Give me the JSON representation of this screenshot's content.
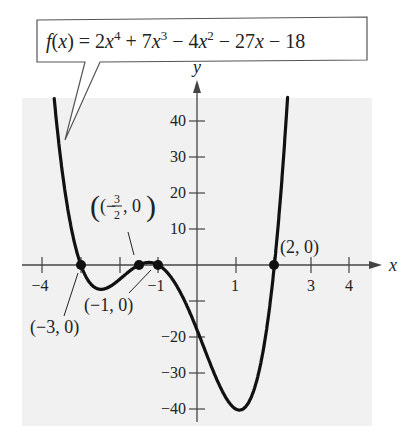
{
  "chart_data": {
    "type": "line",
    "function": {
      "expression": "f(x) = 2x^4 + 7x^3 - 4x^2 - 27x - 18",
      "coefficients": [
        2,
        7,
        -4,
        -27,
        -18
      ]
    },
    "xlabel": "x",
    "ylabel": "y",
    "xlim": [
      -4.5,
      4.6
    ],
    "ylim": [
      -45,
      48
    ],
    "x_ticks": [
      -4,
      -3,
      -2,
      -1,
      1,
      2,
      3,
      4
    ],
    "x_tick_labels": [
      "-4",
      "-1",
      "1",
      "3",
      "4"
    ],
    "y_ticks": [
      -40,
      -30,
      -20,
      -10,
      10,
      20,
      30,
      40
    ],
    "y_tick_labels": [
      "40",
      "30",
      "20",
      "10",
      "-20",
      "-30",
      "-40"
    ],
    "grid": false,
    "series": [
      {
        "name": "f(x)",
        "x": [
          -3.6,
          -3.4,
          -3.2,
          -3.0,
          -2.8,
          -2.6,
          -2.4,
          -2.2,
          -2.0,
          -1.8,
          -1.6,
          -1.5,
          -1.4,
          -1.2,
          -1.0,
          -0.8,
          -0.6,
          -0.4,
          -0.2,
          0,
          0.2,
          0.4,
          0.6,
          0.8,
          1.0,
          1.2,
          1.4,
          1.6,
          1.8,
          2.0,
          2.2,
          2.3
        ],
        "values": [
          45.5,
          26.2,
          11.3,
          0,
          -6.9,
          -9.8,
          -9.4,
          -6.6,
          -4.0,
          -1.3,
          -0.2,
          0,
          0.1,
          -1.2,
          0,
          -3.7,
          -3.0,
          -7.7,
          -12.5,
          -18,
          -23.8,
          -29.3,
          -33.8,
          -36.7,
          -40.0,
          -37.8,
          -33.2,
          -24.5,
          -13.5,
          0,
          18.0,
          28.7
        ]
      }
    ],
    "points": [
      {
        "label": "(-3, 0)",
        "x": -3,
        "y": 0
      },
      {
        "label": "(-3/2, 0)",
        "x": -1.5,
        "y": 0
      },
      {
        "label": "(-1, 0)",
        "x": -1,
        "y": 0
      },
      {
        "label": "(2, 0)",
        "x": 2,
        "y": 0
      }
    ],
    "annotations": [
      "(-3, 0)",
      "(-3/2, 0)",
      "(-1, 0)",
      "(2, 0)",
      "f(x) = 2x^4 + 7x^3 - 4x^2 - 27x - 18"
    ]
  },
  "labels": {
    "callout": {
      "f": "f",
      "open": "(",
      "x": "x",
      "rest": ") = 2",
      "x4": "x",
      "p4": "4",
      "plus7": " + 7",
      "x3": "x",
      "p3": "3",
      "minus4": " − 4",
      "x2": "x",
      "p2": "2",
      "minus27": " − 27",
      "x1": "x",
      "minus18": " − 18"
    },
    "axis_x": "x",
    "axis_y": "y",
    "yticks": {
      "t40": "40",
      "t30": "30",
      "t20": "20",
      "t10": "10",
      "tm20": "−20",
      "tm30": "−30",
      "tm40": "−40"
    },
    "xticks": {
      "tm4": "−4",
      "tm1": "−1",
      "t1": "1",
      "t3": "3",
      "t4": "4"
    },
    "points": {
      "p_m3": "(−3, 0)",
      "p_m32_open": "(−",
      "p_m32_num": "3",
      "p_m32_den": "2",
      "p_m32_close": ", 0)",
      "p_m1": "(−1, 0)",
      "p_2": "(2, 0)"
    }
  },
  "colors": {
    "background_panel": "#f2f2f2",
    "curve": "#111111",
    "axis": "#444444",
    "text": "#222222"
  }
}
